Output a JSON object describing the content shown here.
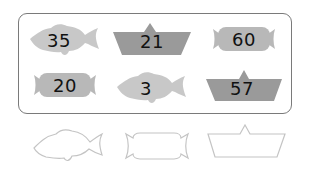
{
  "colors": {
    "fish_fill": "#c8c8c8",
    "boat_fill": "#9a9a9a",
    "candy_fill": "#b8b8b8",
    "outline_stroke": "#c4c4c4",
    "box_border": "#7a7a7a",
    "number_text": "#111111"
  },
  "grid": {
    "items": [
      {
        "shape": "fish-icon",
        "number": "35"
      },
      {
        "shape": "boat-icon",
        "number": "21"
      },
      {
        "shape": "candy-icon",
        "number": "60"
      },
      {
        "shape": "candy-icon",
        "number": "20"
      },
      {
        "shape": "fish-icon",
        "number": "3"
      },
      {
        "shape": "boat-icon",
        "number": "57"
      }
    ]
  },
  "answer_row": {
    "items": [
      {
        "shape": "fish-outline-icon"
      },
      {
        "shape": "candy-outline-icon"
      },
      {
        "shape": "boat-outline-icon"
      }
    ]
  }
}
